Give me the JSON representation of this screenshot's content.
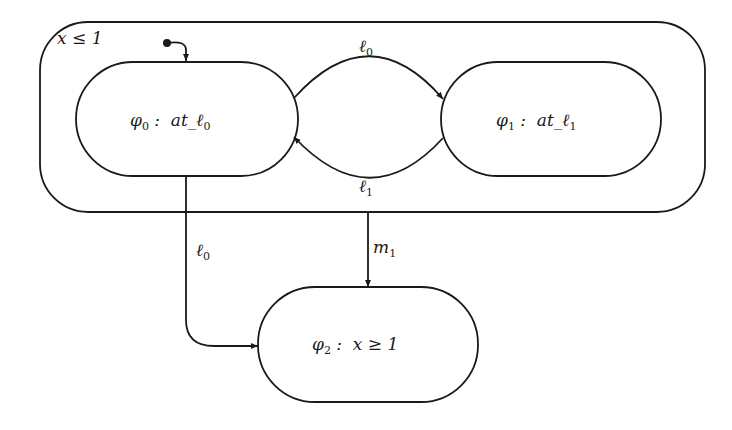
{
  "diagram": {
    "type": "statechart",
    "superstate": {
      "invariant": "x ≤ 1"
    },
    "states": [
      {
        "id": "phi0",
        "name": "φ",
        "sub": "0",
        "sep": " :  ",
        "formula": "at_ℓ",
        "formula_sub": "0"
      },
      {
        "id": "phi1",
        "name": "φ",
        "sub": "1",
        "sep": " :  ",
        "formula": "at_ℓ",
        "formula_sub": "1"
      },
      {
        "id": "phi2",
        "name": "φ",
        "sub": "2",
        "sep": " :  ",
        "formula": "x ≥ 1",
        "formula_sub": ""
      }
    ],
    "transitions": [
      {
        "from": "initial",
        "to": "phi0",
        "label": "",
        "label_sub": ""
      },
      {
        "from": "phi0",
        "to": "phi1",
        "label": "ℓ",
        "label_sub": "0"
      },
      {
        "from": "phi1",
        "to": "phi0",
        "label": "ℓ",
        "label_sub": "1"
      },
      {
        "from": "phi0",
        "to": "phi2",
        "label": "ℓ",
        "label_sub": "0"
      },
      {
        "from": "superstate",
        "to": "phi2",
        "label": "m",
        "label_sub": "1"
      }
    ]
  }
}
